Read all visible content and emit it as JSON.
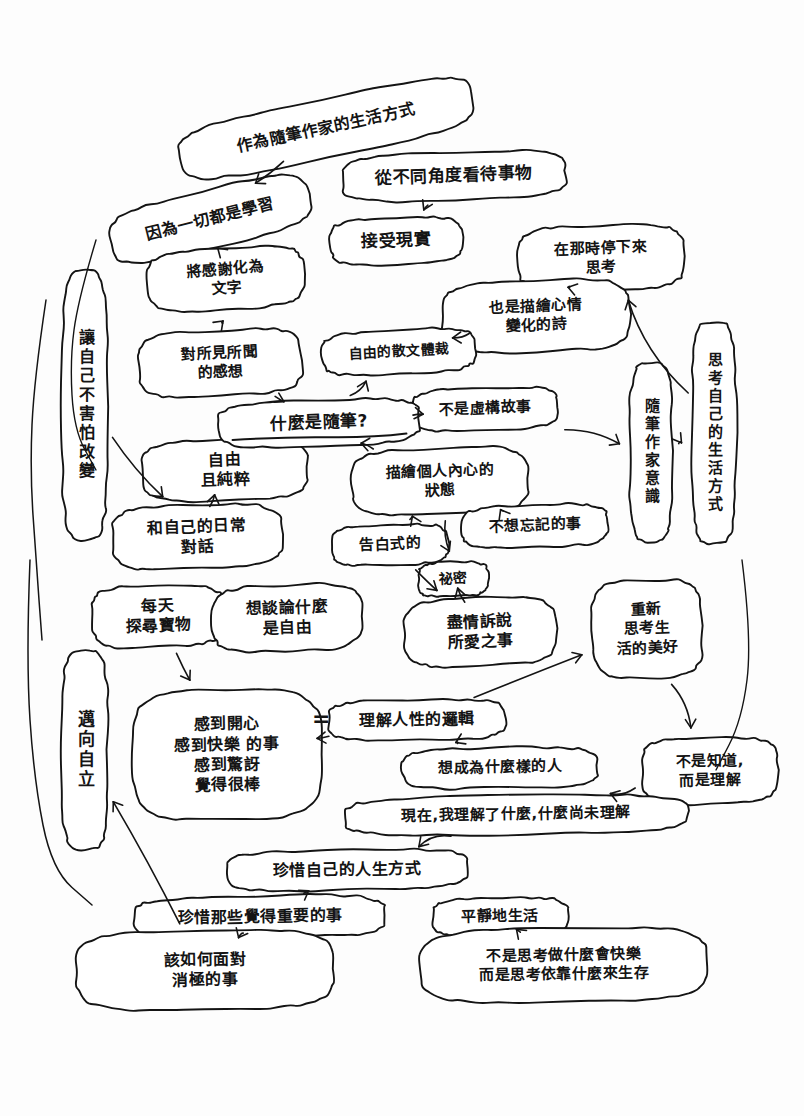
{
  "background_color": "#fdfdfd",
  "ink_color": "#141414",
  "center_node": {
    "id": "center",
    "text": "什麼是隨筆?",
    "underlined": true
  },
  "equals_sign": "=",
  "nodes": [
    {
      "id": "n01",
      "text": "作為隨筆作家的生活方式",
      "x": 176,
      "y": 99,
      "w": 300,
      "h": 58,
      "fs": 16,
      "rot": -12,
      "vertical": false
    },
    {
      "id": "n02",
      "text": "從不同角度看待事物",
      "x": 342,
      "y": 152,
      "w": 224,
      "h": 48,
      "fs": 17,
      "rot": -2,
      "vertical": false
    },
    {
      "id": "n03",
      "text": "因為一切都是學習",
      "x": 108,
      "y": 190,
      "w": 204,
      "h": 58,
      "fs": 16,
      "rot": -14,
      "vertical": false
    },
    {
      "id": "n04",
      "text": "接受現實",
      "x": 330,
      "y": 218,
      "w": 132,
      "h": 46,
      "fs": 17,
      "rot": -2,
      "vertical": false
    },
    {
      "id": "n05",
      "text": "在那時停下來\n思考",
      "x": 518,
      "y": 225,
      "w": 166,
      "h": 66,
      "fs": 15,
      "rot": -2,
      "vertical": false
    },
    {
      "id": "n06",
      "text": "將感謝化為\n文字",
      "x": 148,
      "y": 248,
      "w": 156,
      "h": 62,
      "fs": 15,
      "rot": -4,
      "vertical": false
    },
    {
      "id": "n07",
      "text": "也是描繪心情\n變化的詩",
      "x": 442,
      "y": 280,
      "w": 188,
      "h": 72,
      "fs": 15,
      "rot": -2,
      "vertical": false
    },
    {
      "id": "n08",
      "text": "讓自己不害怕改變",
      "x": 62,
      "y": 270,
      "w": 46,
      "h": 270,
      "fs": 16,
      "rot": 0,
      "vertical": true
    },
    {
      "id": "n09",
      "text": "對所見所聞\n的感想",
      "x": 138,
      "y": 330,
      "w": 164,
      "h": 66,
      "fs": 15,
      "rot": -3,
      "vertical": false
    },
    {
      "id": "n10",
      "text": "自由的散文體裁",
      "x": 322,
      "y": 330,
      "w": 154,
      "h": 44,
      "fs": 14,
      "rot": -3,
      "vertical": false
    },
    {
      "id": "n11",
      "text": "思考自己的生活方式",
      "x": 692,
      "y": 322,
      "w": 44,
      "h": 222,
      "fs": 15,
      "rot": 0,
      "vertical": true
    },
    {
      "id": "n12",
      "text": "不是虛構故事",
      "x": 412,
      "y": 388,
      "w": 146,
      "h": 42,
      "fs": 15,
      "rot": -2,
      "vertical": false
    },
    {
      "id": "n13",
      "text": "隨筆作家意識",
      "x": 630,
      "y": 362,
      "w": 42,
      "h": 180,
      "fs": 15,
      "rot": 0,
      "vertical": true
    },
    {
      "id": "n14",
      "text": "描繪個人內心的\n狀態",
      "x": 352,
      "y": 448,
      "w": 176,
      "h": 66,
      "fs": 15,
      "rot": -2,
      "vertical": false
    },
    {
      "id": "n15",
      "text": "自由\n且純粹",
      "x": 142,
      "y": 440,
      "w": 166,
      "h": 60,
      "fs": 16,
      "rot": -2,
      "vertical": false
    },
    {
      "id": "n16",
      "text": "不想忘記的事",
      "x": 462,
      "y": 505,
      "w": 146,
      "h": 42,
      "fs": 15,
      "rot": -2,
      "vertical": false
    },
    {
      "id": "n17",
      "text": "和自己的日常\n對話",
      "x": 112,
      "y": 505,
      "w": 170,
      "h": 64,
      "fs": 16,
      "rot": -2,
      "vertical": false
    },
    {
      "id": "n18",
      "text": "告白式的",
      "x": 332,
      "y": 525,
      "w": 116,
      "h": 40,
      "fs": 15,
      "rot": -2,
      "vertical": false
    },
    {
      "id": "n19",
      "text": "祕密",
      "x": 418,
      "y": 562,
      "w": 70,
      "h": 34,
      "fs": 14,
      "rot": -2,
      "vertical": false
    },
    {
      "id": "n20",
      "text": "每天\n探尋寶物",
      "x": 92,
      "y": 585,
      "w": 132,
      "h": 62,
      "fs": 16,
      "rot": -2,
      "vertical": false
    },
    {
      "id": "n21",
      "text": "想談論什麼\n是自由",
      "x": 212,
      "y": 585,
      "w": 150,
      "h": 66,
      "fs": 16,
      "rot": -2,
      "vertical": false
    },
    {
      "id": "n22",
      "text": "盡情訴說\n所愛之事",
      "x": 404,
      "y": 598,
      "w": 152,
      "h": 68,
      "fs": 16,
      "rot": -2,
      "vertical": false
    },
    {
      "id": "n23",
      "text": "重新\n思考生\n活的美好",
      "x": 592,
      "y": 580,
      "w": 110,
      "h": 98,
      "fs": 15,
      "rot": -2,
      "vertical": false
    },
    {
      "id": "n24",
      "text": "邁向自立",
      "x": 62,
      "y": 650,
      "w": 46,
      "h": 200,
      "fs": 17,
      "rot": 0,
      "vertical": true
    },
    {
      "id": "n25",
      "text": "感到開心\n感到快樂  的事\n感到驚訝\n覺得很棒",
      "x": 132,
      "y": 690,
      "w": 190,
      "h": 130,
      "fs": 16,
      "rot": -1,
      "vertical": false
    },
    {
      "id": "n26",
      "text": "理解人性的邏輯",
      "x": 328,
      "y": 700,
      "w": 178,
      "h": 40,
      "fs": 16,
      "rot": -1,
      "vertical": false
    },
    {
      "id": "n27",
      "text": "想成為什麼樣的人",
      "x": 402,
      "y": 748,
      "w": 196,
      "h": 40,
      "fs": 15,
      "rot": -1,
      "vertical": false
    },
    {
      "id": "n28",
      "text": "不是知道,\n而是理解",
      "x": 642,
      "y": 738,
      "w": 136,
      "h": 66,
      "fs": 15,
      "rot": -1,
      "vertical": false
    },
    {
      "id": "n29",
      "text": "現在,我理解了什麼,什麼尚未理解",
      "x": 344,
      "y": 796,
      "w": 344,
      "h": 38,
      "fs": 15,
      "rot": -1,
      "vertical": false
    },
    {
      "id": "n30",
      "text": "珍惜自己的人生方式",
      "x": 226,
      "y": 850,
      "w": 242,
      "h": 40,
      "fs": 16,
      "rot": -1,
      "vertical": false
    },
    {
      "id": "n31",
      "text": "平靜地生活",
      "x": 432,
      "y": 898,
      "w": 136,
      "h": 38,
      "fs": 15,
      "rot": -1,
      "vertical": false
    },
    {
      "id": "n32",
      "text": "珍惜那些覺得重要的事",
      "x": 134,
      "y": 896,
      "w": 252,
      "h": 42,
      "fs": 16,
      "rot": -1,
      "vertical": false
    },
    {
      "id": "n33",
      "text": "不是思考做什麼會快樂\n而是思考依靠什麼來生存",
      "x": 420,
      "y": 928,
      "w": 288,
      "h": 74,
      "fs": 15,
      "rot": -1,
      "vertical": false
    },
    {
      "id": "n34",
      "text": "該如何面對\n      消極的事",
      "x": 76,
      "y": 930,
      "w": 258,
      "h": 80,
      "fs": 16,
      "rot": -1,
      "vertical": false
    }
  ],
  "center_position": {
    "x": 218,
    "y": 400,
    "w": 202,
    "h": 46,
    "fs": 17
  },
  "equals_position": {
    "x": 312,
    "y": 706,
    "fs": 22
  },
  "edges": [
    {
      "from": "n01",
      "to": "n03",
      "label": ""
    },
    {
      "from": "n02",
      "to": "n04",
      "label": ""
    },
    {
      "from": "n06",
      "to": "n03",
      "label": ""
    },
    {
      "from": "n09",
      "to": "n06",
      "label": ""
    },
    {
      "from": "n05",
      "to": "n07",
      "label": ""
    },
    {
      "from": "n10",
      "to": "n07",
      "label": ""
    },
    {
      "from": "center",
      "to": "n09",
      "label": ""
    },
    {
      "from": "center",
      "to": "n10",
      "label": ""
    },
    {
      "from": "center",
      "to": "n12",
      "label": ""
    },
    {
      "from": "center",
      "to": "n14",
      "label": ""
    },
    {
      "from": "n14",
      "to": "n16",
      "label": ""
    },
    {
      "from": "n14",
      "to": "n18",
      "label": ""
    },
    {
      "from": "n14",
      "to": "n19",
      "label": ""
    },
    {
      "from": "n12",
      "to": "n13",
      "label": ""
    },
    {
      "from": "n13",
      "to": "n11",
      "label": ""
    },
    {
      "from": "n11",
      "to": "n05",
      "label": ""
    },
    {
      "from": "n15",
      "to": "n17",
      "label": ""
    },
    {
      "from": "n08",
      "to": "n17",
      "label": ""
    },
    {
      "from": "n18",
      "to": "n22",
      "label": ""
    },
    {
      "from": "n19",
      "to": "n22",
      "label": ""
    },
    {
      "from": "n20",
      "to": "n25",
      "label": ""
    },
    {
      "from": "n25",
      "to": "n26",
      "label": ""
    },
    {
      "from": "n26",
      "to": "n27",
      "label": ""
    },
    {
      "from": "n26",
      "to": "n23",
      "label": ""
    },
    {
      "from": "n23",
      "to": "n28",
      "label": ""
    },
    {
      "from": "n28",
      "to": "n29",
      "label": ""
    },
    {
      "from": "n29",
      "to": "n30",
      "label": ""
    },
    {
      "from": "n30",
      "to": "n32",
      "label": ""
    },
    {
      "from": "n32",
      "to": "n34",
      "label": ""
    },
    {
      "from": "n33",
      "to": "n31",
      "label": ""
    },
    {
      "from": "n34",
      "to": "n24",
      "label": ""
    }
  ]
}
